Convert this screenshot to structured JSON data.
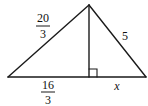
{
  "diagram": {
    "type": "right-triangle-altitude",
    "labels": {
      "left_side": {
        "numerator": "20",
        "denominator": "3"
      },
      "right_side": "5",
      "base_left_segment": {
        "numerator": "16",
        "denominator": "3"
      },
      "base_right_segment": "x"
    },
    "right_angle_marker": "at foot of altitude",
    "stroke_color": "#1a1a1a"
  }
}
